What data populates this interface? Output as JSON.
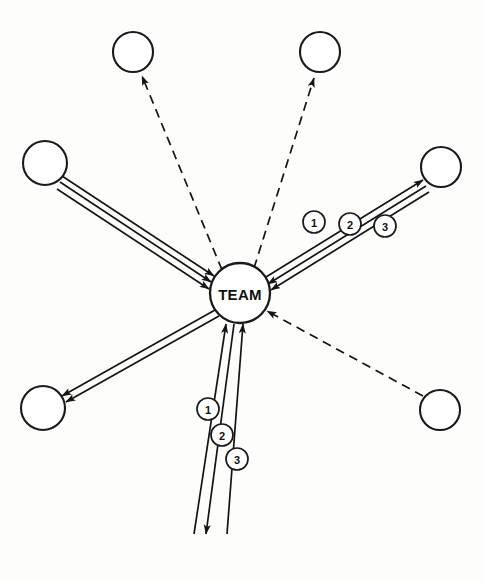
{
  "diagram": {
    "center": {
      "label": "TEAM",
      "cx": 240,
      "cy": 293,
      "r": 30
    },
    "style": {
      "background": "#fdfdfc",
      "line_color": "#141414",
      "node_fill": "#ffffff",
      "node_stroke": "#1a1a1a",
      "text_color": "#111111"
    },
    "nodes": [
      {
        "id": "node-top-left",
        "label": "",
        "cx": 133,
        "cy": 52,
        "r": 20
      },
      {
        "id": "node-top-right",
        "label": "",
        "cx": 320,
        "cy": 52,
        "r": 20
      },
      {
        "id": "node-left",
        "label": "",
        "cx": 45,
        "cy": 163,
        "r": 22
      },
      {
        "id": "node-right",
        "label": "",
        "cx": 441,
        "cy": 167,
        "r": 20
      },
      {
        "id": "node-bottom-left",
        "label": "",
        "cx": 43,
        "cy": 408,
        "r": 22
      },
      {
        "id": "node-bottom-right",
        "label": "",
        "cx": 440,
        "cy": 410,
        "r": 20
      }
    ],
    "links": [
      {
        "id": "link-upper-left-1",
        "style": "solid",
        "direction": "inbound",
        "x1": 62,
        "y1": 176,
        "x2": 214,
        "y2": 276
      },
      {
        "id": "link-upper-left-2",
        "style": "solid",
        "direction": "inbound",
        "x1": 60,
        "y1": 182,
        "x2": 211,
        "y2": 282
      },
      {
        "id": "link-upper-left-3",
        "style": "solid",
        "direction": "inbound",
        "x1": 57,
        "y1": 189,
        "x2": 209,
        "y2": 289
      },
      {
        "id": "link-upper-right-1",
        "style": "solid",
        "direction": "outbound",
        "x1": 266,
        "y1": 277,
        "x2": 423,
        "y2": 180
      },
      {
        "id": "link-upper-right-2",
        "style": "solid",
        "direction": "inbound",
        "x1": 426,
        "y1": 186,
        "x2": 268,
        "y2": 284
      },
      {
        "id": "link-upper-right-3",
        "style": "solid",
        "direction": "inbound",
        "x1": 429,
        "y1": 192,
        "x2": 271,
        "y2": 290
      },
      {
        "id": "link-lower-left-1",
        "style": "solid",
        "direction": "outbound",
        "x1": 215,
        "y1": 310,
        "x2": 62,
        "y2": 396
      },
      {
        "id": "link-lower-left-2",
        "style": "solid",
        "direction": "outbound",
        "x1": 219,
        "y1": 316,
        "x2": 66,
        "y2": 402
      },
      {
        "id": "link-bottom-1",
        "style": "solid",
        "direction": "inbound",
        "x1": 194,
        "y1": 534,
        "x2": 226,
        "y2": 324
      },
      {
        "id": "link-bottom-2",
        "style": "solid",
        "direction": "outbound",
        "x1": 234,
        "y1": 324,
        "x2": 206,
        "y2": 534
      },
      {
        "id": "link-bottom-3",
        "style": "solid",
        "direction": "inbound",
        "x1": 227,
        "y1": 534,
        "x2": 243,
        "y2": 324
      },
      {
        "id": "link-dashed-top-left",
        "style": "dashed",
        "direction": "outbound",
        "x1": 222,
        "y1": 270,
        "x2": 142,
        "y2": 76
      },
      {
        "id": "link-dashed-top-right",
        "style": "dashed",
        "direction": "outbound",
        "x1": 254,
        "y1": 268,
        "x2": 314,
        "y2": 78
      },
      {
        "id": "link-dashed-bottom-right",
        "style": "dashed",
        "direction": "inbound",
        "x1": 423,
        "y1": 396,
        "x2": 267,
        "y2": 311
      }
    ],
    "badges": [
      {
        "id": "badge-ur-1",
        "label": "1",
        "cx": 314,
        "cy": 222,
        "r": 11
      },
      {
        "id": "badge-ur-2",
        "label": "2",
        "cx": 350,
        "cy": 224,
        "r": 11
      },
      {
        "id": "badge-ur-3",
        "label": "3",
        "cx": 385,
        "cy": 226,
        "r": 11
      },
      {
        "id": "badge-b-1",
        "label": "1",
        "cx": 208,
        "cy": 409,
        "r": 11
      },
      {
        "id": "badge-b-2",
        "label": "2",
        "cx": 222,
        "cy": 435,
        "r": 11
      },
      {
        "id": "badge-b-3",
        "label": "3",
        "cx": 237,
        "cy": 459,
        "r": 11
      }
    ]
  }
}
